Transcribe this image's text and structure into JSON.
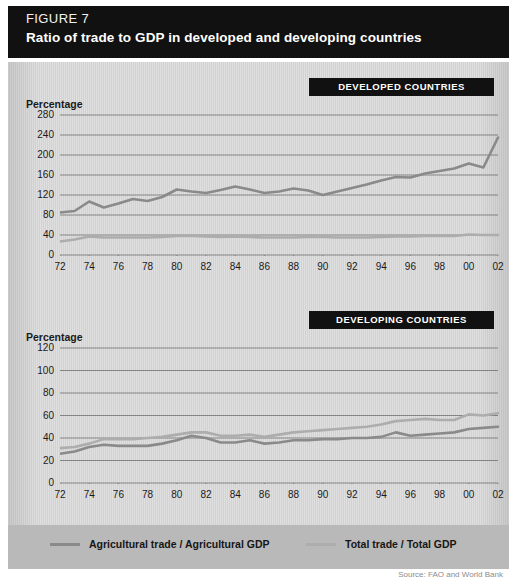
{
  "header": {
    "figure_label": "FIGURE 7",
    "title": "Ratio of trade to GDP in developed and developing countries"
  },
  "legend": {
    "series": [
      {
        "label": "Agricultural trade / Agricultural GDP",
        "color": "#8a8a8a"
      },
      {
        "label": "Total trade / Total GDP",
        "color": "#adadad"
      }
    ]
  },
  "source": "Source: FAO and World Bank",
  "chart_data": [
    {
      "type": "line",
      "title": "DEVELOPED COUNTRIES",
      "xlabel": "",
      "ylabel": "Percentage",
      "ylim": [
        0,
        280
      ],
      "yticks": [
        0,
        40,
        80,
        120,
        160,
        200,
        240,
        280
      ],
      "xlim": [
        1972,
        2002
      ],
      "x": [
        1972,
        1973,
        1974,
        1975,
        1976,
        1977,
        1978,
        1979,
        1980,
        1981,
        1982,
        1983,
        1984,
        1985,
        1986,
        1987,
        1988,
        1989,
        1990,
        1991,
        1992,
        1993,
        1994,
        1995,
        1996,
        1997,
        1998,
        1999,
        2000,
        2001,
        2002
      ],
      "xticklabels": [
        "72",
        "74",
        "76",
        "78",
        "80",
        "82",
        "84",
        "86",
        "88",
        "90",
        "92",
        "94",
        "96",
        "98",
        "00",
        "02"
      ],
      "grid": true,
      "legend_position": "bottom",
      "series": [
        {
          "name": "Agricultural trade / Agricultural GDP",
          "color": "#8a8a8a",
          "values": [
            85,
            88,
            107,
            95,
            103,
            112,
            108,
            116,
            131,
            127,
            124,
            130,
            137,
            131,
            124,
            127,
            133,
            129,
            120,
            127,
            134,
            141,
            149,
            156,
            155,
            163,
            168,
            173,
            183,
            175,
            235
          ]
        },
        {
          "name": "Total trade / Total GDP",
          "color": "#adadad",
          "values": [
            27,
            31,
            37,
            35,
            35,
            35,
            35,
            36,
            38,
            38,
            37,
            36,
            37,
            36,
            35,
            35,
            35,
            36,
            36,
            35,
            35,
            35,
            36,
            37,
            37,
            38,
            38,
            38,
            41,
            40,
            40
          ]
        }
      ]
    },
    {
      "type": "line",
      "title": "DEVELOPING COUNTRIES",
      "xlabel": "",
      "ylabel": "Percentage",
      "ylim": [
        0,
        120
      ],
      "yticks": [
        0,
        20,
        40,
        60,
        80,
        100,
        120
      ],
      "xlim": [
        1972,
        2002
      ],
      "x": [
        1972,
        1973,
        1974,
        1975,
        1976,
        1977,
        1978,
        1979,
        1980,
        1981,
        1982,
        1983,
        1984,
        1985,
        1986,
        1987,
        1988,
        1989,
        1990,
        1991,
        1992,
        1993,
        1994,
        1995,
        1996,
        1997,
        1998,
        1999,
        2000,
        2001,
        2002
      ],
      "xticklabels": [
        "72",
        "74",
        "76",
        "78",
        "80",
        "82",
        "84",
        "86",
        "88",
        "90",
        "92",
        "94",
        "96",
        "98",
        "00",
        "02"
      ],
      "grid": true,
      "legend_position": "bottom",
      "series": [
        {
          "name": "Agricultural trade / Agricultural GDP",
          "color": "#8a8a8a",
          "values": [
            26,
            28,
            32,
            34,
            33,
            33,
            33,
            35,
            38,
            42,
            40,
            36,
            36,
            38,
            35,
            36,
            38,
            38,
            39,
            39,
            40,
            40,
            41,
            45,
            42,
            43,
            44,
            45,
            48,
            49,
            50
          ]
        },
        {
          "name": "Total trade / Total GDP",
          "color": "#adadad",
          "values": [
            31,
            32,
            35,
            39,
            39,
            39,
            40,
            41,
            43,
            45,
            45,
            42,
            42,
            43,
            41,
            43,
            45,
            46,
            47,
            48,
            49,
            50,
            52,
            55,
            56,
            57,
            56,
            56,
            61,
            60,
            62
          ]
        }
      ]
    }
  ]
}
